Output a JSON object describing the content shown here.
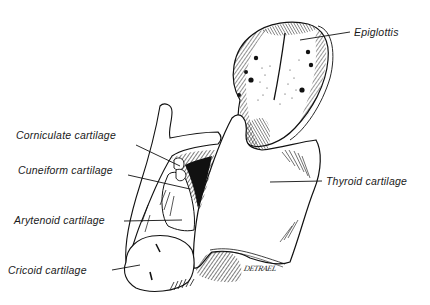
{
  "figure": {
    "labels": {
      "epiglottis": "Epiglottis",
      "corniculate": "Corniculate cartilage",
      "cuneiform": "Cuneiform cartilage",
      "thyroid": "Thyroid cartilage",
      "arytenoid": "Arytenoid cartilage",
      "cricoid": "Cricoid cartilage"
    },
    "signature": "DETRAEL"
  },
  "colors": {
    "ink": "#111111",
    "background": "#ffffff"
  }
}
